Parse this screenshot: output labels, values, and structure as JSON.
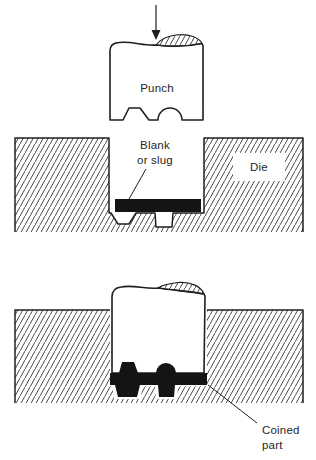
{
  "figure": {
    "stages": [
      {
        "name": "before-coining",
        "punch_label": "Punch",
        "blank_label_line1": "Blank",
        "blank_label_line2": "or slug",
        "die_label": "Die"
      },
      {
        "name": "after-coining",
        "coined_label_line1": "Coined",
        "coined_label_line2": "part"
      }
    ],
    "icons": {
      "force_arrow": "down-arrow"
    },
    "colors": {
      "ink": "#1f1f1f",
      "hatch": "#4a4a4a",
      "solid_fill": "#141414",
      "background": "#ffffff"
    }
  }
}
